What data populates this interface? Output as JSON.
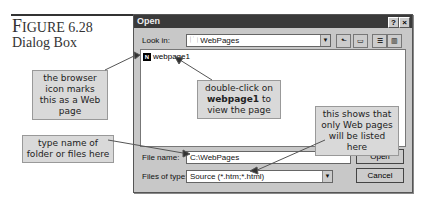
{
  "figure": {
    "label_big": "F",
    "label_rest": "IGURE 6.28",
    "subtitle": "Dialog Box"
  },
  "dialog": {
    "title": "Open",
    "help_button": "?",
    "close_button": "×",
    "look_in_label": "Look in:",
    "look_in_value": "WebPages",
    "files": [
      {
        "name": "webpage1",
        "icon": "N"
      }
    ],
    "file_name_label": "File name:",
    "file_name_value": "C:\\WebPages",
    "files_of_type_label": "Files of type:",
    "files_of_type_value": "Source (*.htm;*.html)",
    "open_button": "Open",
    "cancel_button": "Cancel"
  },
  "callouts": {
    "browser_icon": "the browser icon marks this as a Web page",
    "double_click_pre": "double-click on",
    "double_click_bold": "webpage1",
    "double_click_post": "to view the page",
    "file_type": "this shows that only Web pages will be listed here",
    "type_name": "type name of folder or files here"
  }
}
